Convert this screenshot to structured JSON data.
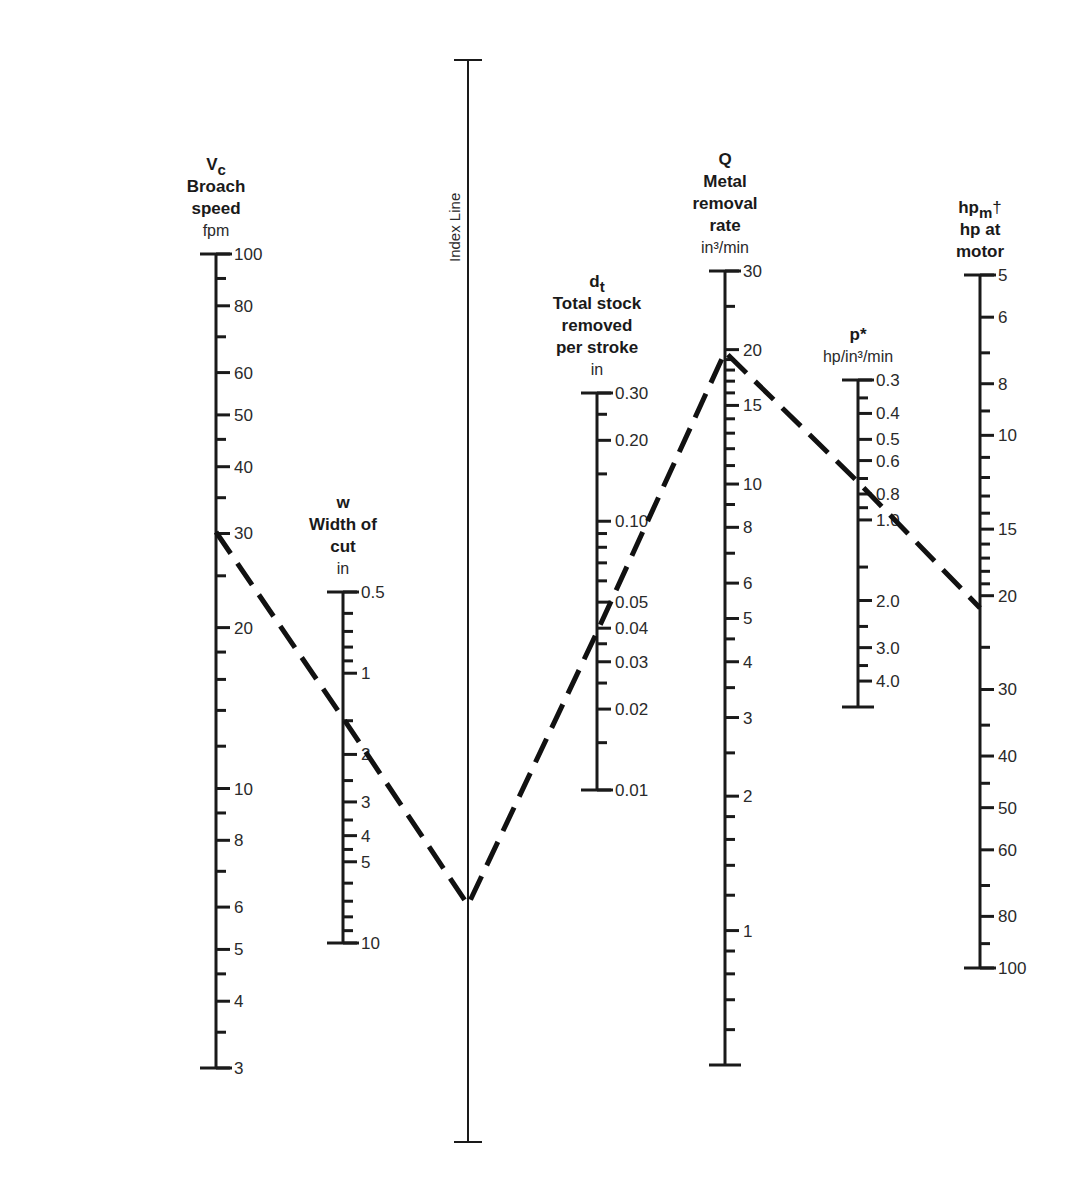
{
  "chart_data": {
    "type": "nomograph",
    "title": "",
    "axes": [
      {
        "id": "vc",
        "symbol": "Vc",
        "name_lines": [
          "Broach",
          "speed"
        ],
        "unit": "fpm",
        "x": 216,
        "scale": "log",
        "range": [
          3,
          100
        ],
        "y_top": 254,
        "y_bottom": 1068,
        "labels": [
          100,
          80,
          60,
          50,
          40,
          30,
          20,
          10,
          8,
          6,
          5,
          4,
          3
        ],
        "label_text": [
          "100",
          "80",
          "60",
          "50",
          "40",
          "30",
          "20",
          "10",
          "8",
          "6",
          "5",
          "4",
          "3"
        ],
        "minor_ticks": [
          90,
          70,
          45,
          35,
          25,
          18,
          16,
          14,
          12,
          9,
          7,
          4.5,
          3.5
        ]
      },
      {
        "id": "w",
        "symbol": "w",
        "name_lines": [
          "Width of",
          "cut"
        ],
        "unit": "in",
        "x": 343,
        "scale": "log_inverted",
        "range": [
          0.5,
          10
        ],
        "y_top": 592,
        "y_bottom": 943,
        "labels": [
          0.5,
          1,
          2,
          3,
          4,
          5,
          10
        ],
        "label_text": [
          "0.5",
          "1",
          "2",
          "3",
          "4",
          "5",
          "10"
        ],
        "minor_ticks": [
          0.6,
          0.7,
          0.8,
          0.9,
          1.5,
          2.5,
          3.5,
          4.5,
          6,
          7,
          8,
          9
        ]
      },
      {
        "id": "index",
        "name": "Index Line",
        "x": 468,
        "y_top": 60,
        "y_bottom": 1142
      },
      {
        "id": "dt",
        "symbol": "dt",
        "name_lines": [
          "Total stock",
          "removed",
          "per stroke"
        ],
        "unit": "in",
        "x": 597,
        "scale": "log",
        "range": [
          0.01,
          0.3
        ],
        "y_top": 393,
        "y_bottom": 790,
        "labels": [
          0.3,
          0.2,
          0.1,
          0.05,
          0.04,
          0.03,
          0.02,
          0.01
        ],
        "label_text": [
          "0.30",
          "0.20",
          "0.10",
          "0.05",
          "0.04",
          "0.03",
          "0.02",
          "0.01"
        ],
        "minor_ticks": [
          0.25,
          0.15,
          0.09,
          0.08,
          0.07,
          0.06,
          0.035,
          0.025,
          0.015
        ]
      },
      {
        "id": "q",
        "symbol": "Q",
        "name_lines": [
          "Metal",
          "removal",
          "rate"
        ],
        "unit": "in³/min",
        "x": 725,
        "scale": "log",
        "range": [
          0.5,
          30
        ],
        "y_top": 271,
        "y_bottom": 1065,
        "labels": [
          30,
          20,
          15,
          10,
          8,
          6,
          5,
          4,
          3,
          2,
          1
        ],
        "label_text": [
          "30",
          "20",
          "15",
          "10",
          "8",
          "6",
          "5",
          "4",
          "3",
          "2",
          "1"
        ],
        "minor_ticks": [
          25,
          19,
          18,
          17,
          16,
          14,
          13,
          12,
          11,
          9,
          7,
          4.5,
          3.5,
          2.5,
          1.8,
          1.6,
          1.4,
          1.2,
          0.9,
          0.8,
          0.7,
          0.6
        ]
      },
      {
        "id": "p",
        "symbol": "p*",
        "name_lines": [],
        "unit": "hp/in³/min",
        "x": 858,
        "scale": "log_inverted",
        "range": [
          0.3,
          5
        ],
        "y_top": 380,
        "y_bottom": 707,
        "labels": [
          0.3,
          0.4,
          0.5,
          0.6,
          0.8,
          1.0,
          2.0,
          3.0,
          4.0
        ],
        "label_text": [
          "0.3",
          "0.4",
          "0.5",
          "0.6",
          "0.8",
          "1.0",
          "2.0",
          "3.0",
          "4.0"
        ],
        "minor_ticks": [
          0.35,
          0.7,
          0.9,
          1.5,
          2.5,
          3.5
        ]
      },
      {
        "id": "hpm",
        "symbol": "hpm†",
        "name_lines": [
          "hp at",
          "motor"
        ],
        "unit": "",
        "x": 980,
        "scale": "log_inverted",
        "range": [
          5,
          100
        ],
        "y_top": 275,
        "y_bottom": 968,
        "labels": [
          5,
          6,
          8,
          10,
          15,
          20,
          30,
          40,
          50,
          60,
          80,
          100
        ],
        "label_text": [
          "5",
          "6",
          "8",
          "10",
          "15",
          "20",
          "30",
          "40",
          "50",
          "60",
          "80",
          "100"
        ],
        "minor_ticks": [
          7,
          9,
          11,
          12,
          13,
          14,
          16,
          17,
          18,
          19,
          25,
          35,
          45,
          70,
          90
        ]
      }
    ],
    "example_solution": {
      "style": "dashed",
      "path_values": [
        {
          "axis": "vc",
          "value": 30
        },
        {
          "axis": "w",
          "value": 1.6
        },
        {
          "axis": "index",
          "y": 905
        },
        {
          "axis": "dt",
          "value": 0.042
        },
        {
          "axis": "q",
          "value": 22
        },
        {
          "axis": "p",
          "value": 0.75
        },
        {
          "axis": "hpm",
          "value": 21
        }
      ],
      "path_points": [
        [
          216,
          532
        ],
        [
          343,
          718
        ],
        [
          468,
          905
        ],
        [
          597,
          632
        ],
        [
          725,
          352
        ],
        [
          858,
          482
        ],
        [
          980,
          608
        ]
      ]
    }
  }
}
